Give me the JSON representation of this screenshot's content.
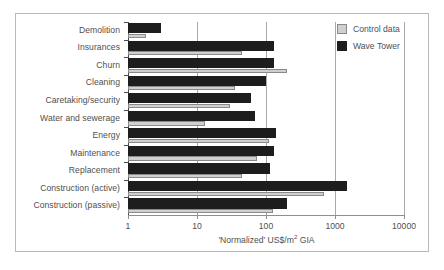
{
  "chart_data": {
    "type": "bar",
    "orientation": "horizontal",
    "title": "",
    "xlabel": "'Normalized' US$/m2 GIA",
    "xlabel_parts": {
      "pre": "'Normalized' US$/m",
      "sup": "2",
      "post": " GIA"
    },
    "ylabel": "",
    "xscale": "log",
    "xlim": [
      1,
      10000
    ],
    "xticks": [
      1,
      10,
      100,
      1000,
      10000
    ],
    "xtick_labels": [
      "1",
      "10",
      "100",
      "1000",
      "10000"
    ],
    "grid": "vertical-major",
    "legend_position": "top-right",
    "categories": [
      "Demolition",
      "Insurances",
      "Churn",
      "Cleaning",
      "Caretaking/security",
      "Water and sewerage",
      "Energy",
      "Maintenance",
      "Replacement",
      "Construction (active)",
      "Construction (passive)"
    ],
    "series": [
      {
        "name": "Control data",
        "color": "#cfcfcf",
        "values": [
          1.8,
          45,
          200,
          35,
          30,
          13,
          110,
          75,
          45,
          700,
          125
        ]
      },
      {
        "name": "Wave Tower",
        "color": "#1d1d1d",
        "values": [
          3,
          130,
          130,
          100,
          60,
          70,
          140,
          130,
          115,
          1500,
          200
        ]
      }
    ]
  },
  "legend": {
    "items": [
      {
        "label": "Control data",
        "swatch": "light"
      },
      {
        "label": "Wave Tower",
        "swatch": "dark"
      }
    ]
  },
  "colors": {
    "control_data": "#cfcfcf",
    "wave_tower": "#1d1d1d",
    "gridline": "#a9a9a9",
    "axis": "#4a4a4a",
    "text": "#4f4f4f",
    "frame": "#b9b9b9",
    "background": "#ffffff"
  }
}
